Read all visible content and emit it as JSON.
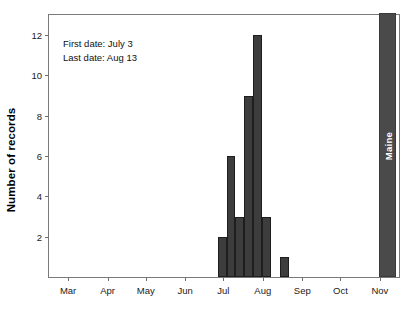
{
  "figure": {
    "background_color": "#ffffff",
    "bar_color": "#3d3d3d",
    "bar_edge_color": "#1e1e1e",
    "axis_color": "#7a7a7a",
    "state_bar_color": "#4a4a4a",
    "state_label_color": "#ffffff"
  },
  "annotation": {
    "first_date": "First date: July 3",
    "last_date": "Last date: Aug 13"
  },
  "state_bar": {
    "label": "Maine"
  },
  "chart_data": {
    "type": "bar",
    "title": "",
    "subtitle": "",
    "xlabel": "",
    "ylabel": "Number of records",
    "ylim": [
      0,
      13
    ],
    "yticks": [
      2,
      4,
      6,
      8,
      10,
      12
    ],
    "ytick_labels": [
      "2",
      "4",
      "6",
      "8",
      "10",
      "12"
    ],
    "xlim": [
      0,
      275
    ],
    "xticks": [
      15,
      46,
      76,
      107,
      137,
      168,
      199,
      229,
      260
    ],
    "xtick_labels": [
      "Mar",
      "Apr",
      "May",
      "Jun",
      "Jul",
      "Aug",
      "Sep",
      "Oct",
      "Nov"
    ],
    "grid": false,
    "legend": null,
    "legend_position": "none",
    "categories": [
      "Jul 3",
      "Jul 10",
      "Jul 17",
      "Jul 24",
      "Jul 31",
      "Aug 7",
      "Aug 13",
      "Maine"
    ],
    "values": [
      2,
      6,
      3,
      9,
      12,
      3,
      1,
      13
    ],
    "bars": [
      {
        "name": "bin-jul-03",
        "x_center": 136,
        "width": 7,
        "value": 2,
        "off_scale": false,
        "label": ""
      },
      {
        "name": "bin-jul-10",
        "x_center": 143,
        "width": 7,
        "value": 6,
        "off_scale": false,
        "label": ""
      },
      {
        "name": "bin-jul-17",
        "x_center": 150,
        "width": 7,
        "value": 3,
        "off_scale": false,
        "label": ""
      },
      {
        "name": "bin-jul-24",
        "x_center": 157,
        "width": 7,
        "value": 9,
        "off_scale": false,
        "label": ""
      },
      {
        "name": "bin-jul-31",
        "x_center": 164,
        "width": 7,
        "value": 12,
        "off_scale": false,
        "label": ""
      },
      {
        "name": "bin-aug-07",
        "x_center": 171,
        "width": 7,
        "value": 3,
        "off_scale": false,
        "label": ""
      },
      {
        "name": "bin-aug-13",
        "x_center": 185,
        "width": 7,
        "value": 1,
        "off_scale": false,
        "label": ""
      },
      {
        "name": "state-total",
        "x_center": 266,
        "width": 14,
        "value": 13,
        "off_scale": true,
        "label": "Maine"
      }
    ],
    "annotations": [
      "First date: July 3",
      "Last date: Aug 13"
    ]
  }
}
